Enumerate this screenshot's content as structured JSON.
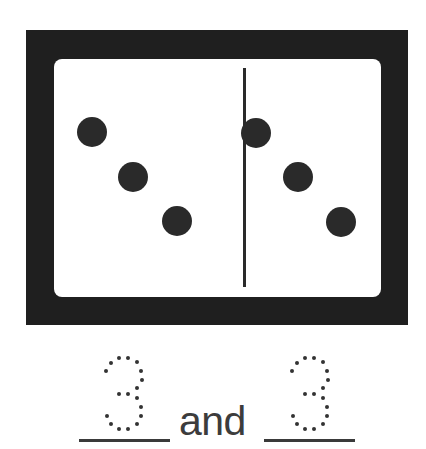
{
  "domino": {
    "left_half": {
      "pip_count": 3
    },
    "right_half": {
      "pip_count": 3
    }
  },
  "sentence": {
    "blank1_traced_value": "3",
    "connector": "and",
    "blank2_traced_value": "3"
  },
  "colors": {
    "domino_frame": "#1f1f1f",
    "pip": "#2a2a2a",
    "text": "#3c3c3c"
  }
}
